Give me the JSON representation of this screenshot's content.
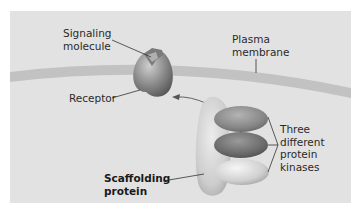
{
  "figure": {
    "labels": {
      "signaling_molecule": [
        "Signaling",
        "molecule"
      ],
      "plasma_membrane": [
        "Plasma",
        "membrane"
      ],
      "receptor": "Receptor",
      "scaffolding_protein": [
        "Scaffolding",
        "protein"
      ],
      "kinases": [
        "Three",
        "different",
        "protein",
        "kinases"
      ]
    },
    "colors": {
      "panel": "#e2e2e2",
      "membrane": "#c4c4c4",
      "receptor": "#8f8f8f",
      "scaffold": "#d2d2d2",
      "kinase_top": "#8a8a8a",
      "kinase_mid": "#6e6e6e",
      "kinase_bottom": "#cfcfcf"
    }
  }
}
